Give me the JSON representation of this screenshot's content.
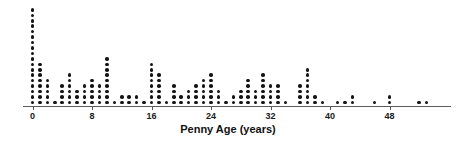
{
  "chart_data": {
    "type": "dotplot",
    "title": "",
    "subtitle": "",
    "xlabel": "Penny Age (years)",
    "ylabel": "",
    "xlim": [
      -1,
      56
    ],
    "ylim": [
      0,
      19
    ],
    "grid": false,
    "legend": null,
    "tick_labels": [
      "0",
      "8",
      "16",
      "24",
      "32",
      "40",
      "48"
    ],
    "tick_values": [
      0,
      8,
      16,
      24,
      32,
      40,
      48
    ],
    "dot_color": "#141414",
    "axis_color": "#5a5a5a",
    "background_color": "#ffffff",
    "note": "Each dot represents one penny; stack height = count at that age.",
    "categories": [
      0,
      1,
      2,
      3,
      4,
      5,
      6,
      7,
      8,
      9,
      10,
      11,
      12,
      13,
      14,
      15,
      16,
      17,
      18,
      19,
      20,
      21,
      22,
      23,
      24,
      25,
      26,
      27,
      28,
      29,
      30,
      31,
      32,
      33,
      34,
      35,
      36,
      37,
      38,
      39,
      40,
      41,
      42,
      43,
      44,
      45,
      46,
      47,
      48,
      49,
      50,
      51,
      52,
      53,
      54
    ],
    "values": [
      18,
      8,
      5,
      1,
      4,
      6,
      3,
      4,
      5,
      4,
      9,
      1,
      2,
      2,
      2,
      1,
      8,
      6,
      1,
      4,
      2,
      3,
      4,
      5,
      6,
      3,
      1,
      2,
      3,
      5,
      3,
      6,
      4,
      4,
      1,
      0,
      4,
      7,
      2,
      1,
      0,
      1,
      1,
      2,
      0,
      0,
      1,
      0,
      2,
      0,
      0,
      0,
      1,
      1,
      0
    ]
  },
  "axis": {
    "x_title": "Penny Age (years)"
  }
}
